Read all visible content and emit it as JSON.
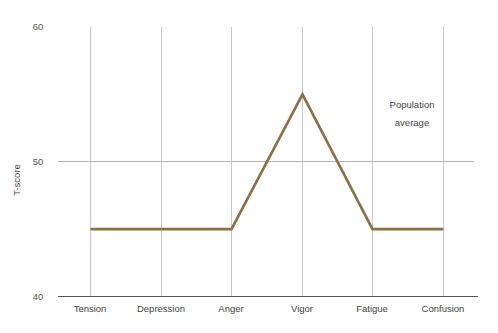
{
  "chart_data": {
    "type": "line",
    "title": "",
    "xlabel": "",
    "ylabel": "T-score",
    "categories": [
      "Tension",
      "Depression",
      "Anger",
      "Vigor",
      "Fatigue",
      "Confusion"
    ],
    "series": [
      {
        "name": "Population average",
        "values": [
          45,
          45,
          45,
          55,
          45,
          45
        ],
        "color": "#8b6f47"
      }
    ],
    "ylim": [
      40,
      60
    ],
    "yticks": [
      40,
      50,
      60
    ],
    "ytick_labels": [
      "40",
      "50",
      "60"
    ],
    "grid": {
      "vertical": true,
      "horizontal_at": [
        50
      ]
    },
    "legend_position": "none",
    "annotations": [
      {
        "name": "population-average-annotation",
        "lines": [
          "Population",
          "average"
        ],
        "x_value": 5.05,
        "y_value": 54.0
      }
    ]
  },
  "axes": {
    "y_title": "T-score",
    "y_tick_top": "60",
    "y_tick_mid": "50",
    "y_tick_bottom": "40"
  },
  "categories": {
    "c0": "Tension",
    "c1": "Depression",
    "c2": "Anger",
    "c3": "Vigor",
    "c4": "Fatigue",
    "c5": "Confusion"
  },
  "annotation": {
    "line1": "Population",
    "line2": "average"
  },
  "colors": {
    "series_line": "#8b6f47",
    "gridline": "#c8c8c8",
    "axis": "#555555",
    "text": "#444444",
    "background": "#ffffff"
  }
}
